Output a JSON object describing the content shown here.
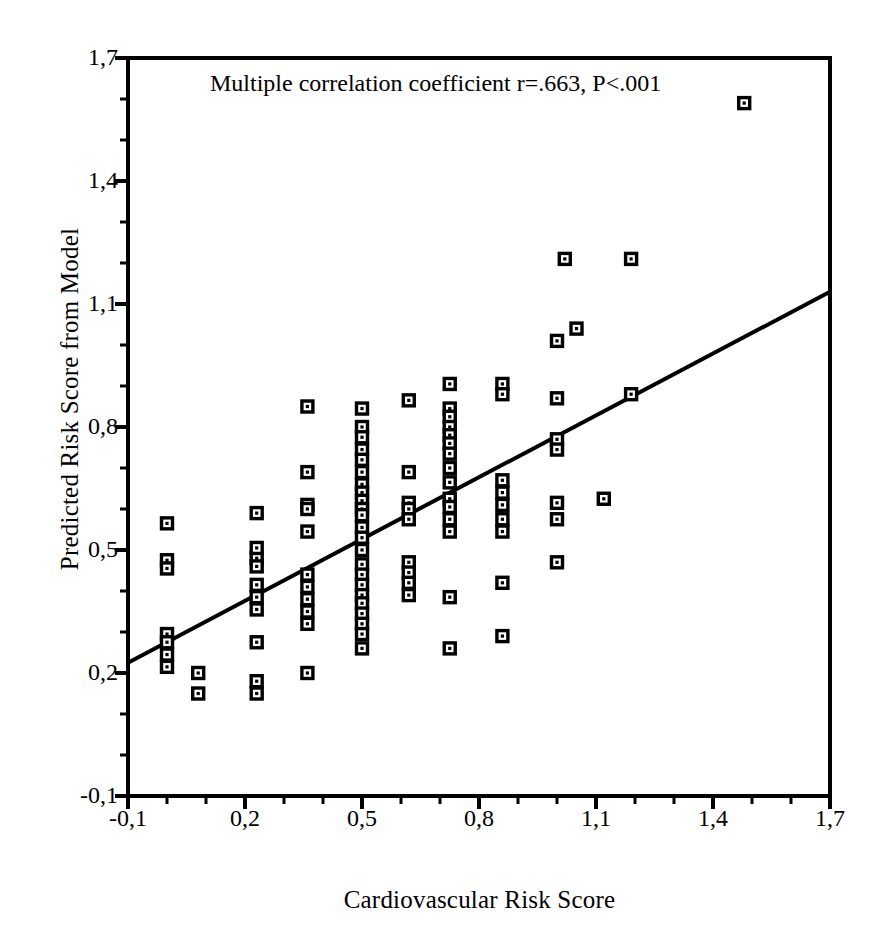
{
  "chart_data": {
    "type": "scatter",
    "title": "",
    "annotation": "Multiple correlation coefficient r=.663, P<.001",
    "xlabel": "Cardiovascular Risk Score",
    "ylabel": "Predicted Risk Score from Model",
    "xlim": [
      -0.1,
      1.7
    ],
    "ylim": [
      -0.1,
      1.7
    ],
    "xticks": [
      -0.1,
      0.2,
      0.5,
      0.8,
      1.1,
      1.4,
      1.7
    ],
    "xticklabels": [
      "-0,1",
      "0,2",
      "0,5",
      "0,8",
      "1,1",
      "1,4",
      "1,7"
    ],
    "yticks": [
      -0.1,
      0.2,
      0.5,
      0.8,
      1.1,
      1.4,
      1.7
    ],
    "yticklabels": [
      "-0,1",
      "0,2",
      "0,5",
      "0,8",
      "1,1",
      "1,4",
      "1,7"
    ],
    "minor_ticks_per_interval": 2,
    "grid": false,
    "legend": false,
    "marker": "open-square",
    "marker_size": 11,
    "marker_edge_color": "#000000",
    "marker_face_color": "#ffffff",
    "line_color": "#000000",
    "line_width": 4,
    "regression_line": {
      "x": [
        -0.1,
        1.7
      ],
      "y": [
        0.225,
        1.13
      ],
      "slope": 0.503,
      "intercept": 0.275
    },
    "points": [
      [
        0.0,
        0.565
      ],
      [
        0.0,
        0.475
      ],
      [
        0.0,
        0.455
      ],
      [
        0.0,
        0.295
      ],
      [
        0.0,
        0.275
      ],
      [
        0.0,
        0.245
      ],
      [
        0.0,
        0.215
      ],
      [
        0.08,
        0.2
      ],
      [
        0.08,
        0.15
      ],
      [
        0.23,
        0.48
      ],
      [
        0.23,
        0.59
      ],
      [
        0.23,
        0.505
      ],
      [
        0.23,
        0.46
      ],
      [
        0.23,
        0.415
      ],
      [
        0.23,
        0.385
      ],
      [
        0.23,
        0.355
      ],
      [
        0.23,
        0.275
      ],
      [
        0.23,
        0.18
      ],
      [
        0.23,
        0.15
      ],
      [
        0.36,
        0.85
      ],
      [
        0.36,
        0.69
      ],
      [
        0.36,
        0.61
      ],
      [
        0.36,
        0.6
      ],
      [
        0.36,
        0.545
      ],
      [
        0.36,
        0.44
      ],
      [
        0.36,
        0.41
      ],
      [
        0.36,
        0.38
      ],
      [
        0.36,
        0.35
      ],
      [
        0.36,
        0.32
      ],
      [
        0.36,
        0.2
      ],
      [
        0.5,
        0.845
      ],
      [
        0.5,
        0.8
      ],
      [
        0.5,
        0.775
      ],
      [
        0.5,
        0.745
      ],
      [
        0.5,
        0.72
      ],
      [
        0.5,
        0.69
      ],
      [
        0.5,
        0.66
      ],
      [
        0.5,
        0.64
      ],
      [
        0.5,
        0.62
      ],
      [
        0.5,
        0.6
      ],
      [
        0.5,
        0.585
      ],
      [
        0.5,
        0.555
      ],
      [
        0.5,
        0.53
      ],
      [
        0.5,
        0.5
      ],
      [
        0.5,
        0.465
      ],
      [
        0.5,
        0.44
      ],
      [
        0.5,
        0.415
      ],
      [
        0.5,
        0.39
      ],
      [
        0.5,
        0.37
      ],
      [
        0.5,
        0.345
      ],
      [
        0.5,
        0.32
      ],
      [
        0.5,
        0.295
      ],
      [
        0.5,
        0.26
      ],
      [
        0.62,
        0.865
      ],
      [
        0.62,
        0.69
      ],
      [
        0.62,
        0.615
      ],
      [
        0.62,
        0.6
      ],
      [
        0.62,
        0.575
      ],
      [
        0.62,
        0.47
      ],
      [
        0.62,
        0.445
      ],
      [
        0.62,
        0.42
      ],
      [
        0.62,
        0.39
      ],
      [
        0.725,
        0.905
      ],
      [
        0.725,
        0.845
      ],
      [
        0.725,
        0.825
      ],
      [
        0.725,
        0.8
      ],
      [
        0.725,
        0.78
      ],
      [
        0.725,
        0.76
      ],
      [
        0.725,
        0.735
      ],
      [
        0.725,
        0.7
      ],
      [
        0.725,
        0.665
      ],
      [
        0.725,
        0.625
      ],
      [
        0.725,
        0.605
      ],
      [
        0.725,
        0.575
      ],
      [
        0.725,
        0.545
      ],
      [
        0.725,
        0.385
      ],
      [
        0.725,
        0.26
      ],
      [
        0.86,
        0.905
      ],
      [
        0.86,
        0.88
      ],
      [
        0.86,
        0.67
      ],
      [
        0.86,
        0.64
      ],
      [
        0.86,
        0.61
      ],
      [
        0.86,
        0.575
      ],
      [
        0.86,
        0.545
      ],
      [
        0.86,
        0.42
      ],
      [
        0.86,
        0.29
      ],
      [
        1.0,
        1.01
      ],
      [
        1.0,
        0.87
      ],
      [
        1.0,
        0.77
      ],
      [
        1.0,
        0.745
      ],
      [
        1.0,
        0.615
      ],
      [
        1.0,
        0.575
      ],
      [
        1.0,
        0.47
      ],
      [
        1.02,
        1.21
      ],
      [
        1.05,
        1.04
      ],
      [
        1.19,
        1.21
      ],
      [
        1.19,
        0.88
      ],
      [
        1.12,
        0.625
      ],
      [
        1.48,
        1.59
      ]
    ]
  }
}
